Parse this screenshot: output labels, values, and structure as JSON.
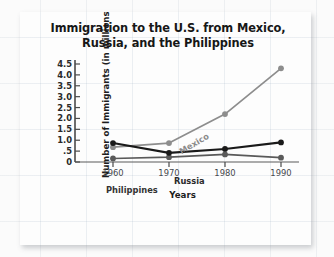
{
  "chart_data": {
    "type": "line",
    "title": "Immigration to the U.S. from Mexico, Russia, and the Philippines",
    "title_line1": "Immigration to the U.S. from Mexico,",
    "title_line2": "Russia, and the Philippines",
    "xlabel": "Years",
    "ylabel": "Number of Immigrants (in millions)",
    "x": [
      1960,
      1970,
      1980,
      1990
    ],
    "xticklabels": [
      "1960",
      "1970",
      "1980",
      "1990"
    ],
    "yticks": [
      0,
      0.5,
      1.0,
      1.5,
      2.0,
      2.5,
      3.0,
      3.5,
      4.0,
      4.5
    ],
    "yticklabels": [
      "0",
      ".5",
      "1.0",
      "1.5",
      "2.0",
      "2.5",
      "3.0",
      "3.5",
      "4.0",
      "4.5"
    ],
    "ylim": [
      0,
      4.6
    ],
    "xlim": [
      1955,
      1995
    ],
    "grid": false,
    "legend": "inline-labels",
    "series": [
      {
        "name": "Mexico",
        "color": "#8d8d8d",
        "marker": "circle",
        "values": [
          0.68,
          0.87,
          2.2,
          4.3
        ]
      },
      {
        "name": "Russia",
        "color": "#1a1a1a",
        "marker": "circle",
        "values": [
          0.87,
          0.42,
          0.6,
          0.9
        ]
      },
      {
        "name": "Philippines",
        "color": "#5a5a5a",
        "marker": "circle",
        "values": [
          0.16,
          0.22,
          0.35,
          0.2
        ]
      }
    ]
  },
  "annotations": {
    "mexico_label": "Mexico",
    "russia_label": "Russia",
    "philippines_label": "Philippines"
  }
}
